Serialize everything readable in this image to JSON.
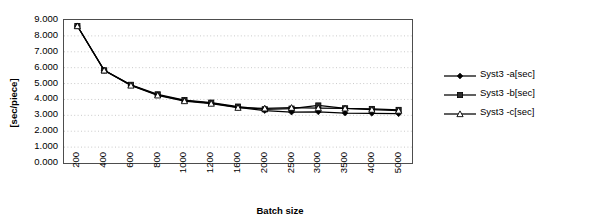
{
  "chart_data": {
    "type": "line",
    "title": "",
    "xlabel": "Batch size",
    "ylabel": "[sec/piece]",
    "categories": [
      "200",
      "400",
      "600",
      "800",
      "1000",
      "1200",
      "1600",
      "2000",
      "2500",
      "3000",
      "3500",
      "4000",
      "5000"
    ],
    "ylim": [
      0,
      9
    ],
    "ytick_labels": [
      "9.000",
      "8.000",
      "7.000",
      "6.000",
      "5.000",
      "4.000",
      "3.000",
      "2.000",
      "1.000",
      "0.000"
    ],
    "ytick_values": [
      9,
      8,
      7,
      6,
      5,
      4,
      3,
      2,
      1,
      0
    ],
    "grid": true,
    "grid_style": "dotted-horizontal",
    "legend_position": "right",
    "series": [
      {
        "name": "Syst3 -a[sec]",
        "marker": "filled-diamond",
        "color": "#000000",
        "values": [
          8.62,
          5.83,
          4.9,
          4.28,
          3.93,
          3.77,
          3.5,
          3.3,
          3.2,
          3.22,
          3.14,
          3.13,
          3.1
        ]
      },
      {
        "name": "Syst3 -b[sec]",
        "marker": "filled-square",
        "color": "#000000",
        "values": [
          8.62,
          5.83,
          4.92,
          4.32,
          3.96,
          3.8,
          3.55,
          3.38,
          3.42,
          3.62,
          3.44,
          3.4,
          3.34
        ]
      },
      {
        "name": "Syst3 -c[sec]",
        "marker": "open-triangle",
        "color": "#000000",
        "values": [
          8.62,
          5.83,
          4.88,
          4.26,
          3.9,
          3.74,
          3.48,
          3.44,
          3.48,
          3.46,
          3.44,
          3.36,
          3.3
        ]
      }
    ]
  },
  "axes": {
    "y_title": "[sec/piece]",
    "x_title": "Batch size"
  },
  "legend": {
    "items": [
      {
        "label": "Syst3 -a[sec]",
        "marker": "filled-diamond-icon"
      },
      {
        "label": "Syst3 -b[sec]",
        "marker": "filled-square-icon"
      },
      {
        "label": "Syst3 -c[sec]",
        "marker": "open-triangle-icon"
      }
    ]
  }
}
